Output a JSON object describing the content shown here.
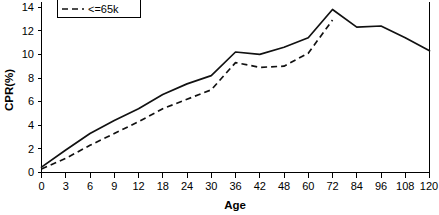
{
  "chart_data": {
    "type": "line",
    "title": "",
    "xlabel": "Age",
    "ylabel": "CPR(%)",
    "categories": [
      "0",
      "3",
      "6",
      "9",
      "12",
      "18",
      "24",
      "30",
      "36",
      "42",
      "48",
      "60",
      "72",
      "84",
      "96",
      "108",
      "120"
    ],
    "x_tick_labels": [
      "0",
      "3",
      "6",
      "9",
      "12",
      "18",
      "24",
      "30",
      "36",
      "42",
      "48",
      "60",
      "72",
      "84",
      "96",
      "108",
      "120"
    ],
    "y_tick_labels": [
      "0",
      "2",
      "4",
      "6",
      "8",
      "10",
      "12",
      "14"
    ],
    "y_ticks": [
      0,
      2,
      4,
      6,
      8,
      10,
      12,
      14
    ],
    "ylim": [
      0,
      14.6
    ],
    "grid": false,
    "legend_position": "top-left",
    "series": [
      {
        "name": "Generics",
        "style": "solid",
        "values": [
          0.45,
          1.9,
          3.3,
          4.4,
          5.4,
          6.6,
          7.5,
          8.2,
          10.2,
          10.0,
          10.6,
          11.4,
          13.8,
          12.3,
          12.4,
          11.4,
          10.3
        ]
      },
      {
        "name": "<=65k",
        "style": "dashed",
        "values": [
          0.3,
          1.2,
          2.3,
          3.3,
          4.3,
          5.4,
          6.2,
          7.0,
          9.3,
          8.9,
          9.0,
          10.1,
          12.9,
          null,
          null,
          null,
          null
        ]
      }
    ]
  },
  "legend": {
    "entries": [
      {
        "label": "Generics",
        "style": "solid"
      },
      {
        "label": "<=65k",
        "style": "dashed"
      }
    ]
  },
  "axes": {
    "x_title": "Age",
    "y_title": "CPR(%)"
  }
}
